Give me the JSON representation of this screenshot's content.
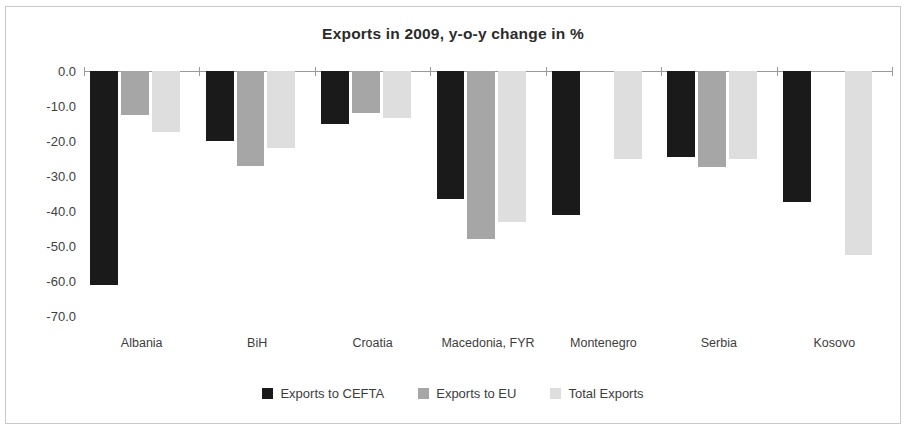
{
  "chart_data": {
    "type": "bar",
    "title": "Exports in 2009, y-o-y change in %",
    "xlabel": "",
    "ylabel": "",
    "ylim": [
      -70,
      0
    ],
    "ytick_step": 10,
    "grid": false,
    "legend_position": "bottom",
    "yticks": [
      "0.0",
      "-10.0",
      "-20.0",
      "-30.0",
      "-40.0",
      "-50.0",
      "-60.0",
      "-70.0"
    ],
    "ytick_values": [
      0,
      -10,
      -20,
      -30,
      -40,
      -50,
      -60,
      -70
    ],
    "categories": [
      "Albania",
      "BiH",
      "Croatia",
      "Macedonia, FYR",
      "Montenegro",
      "Serbia",
      "Kosovo"
    ],
    "series": [
      {
        "name": "Exports to CEFTA",
        "color": "#1a1a1a",
        "values": [
          -61.0,
          -20.0,
          -15.0,
          -36.5,
          -41.0,
          -24.5,
          -37.5
        ]
      },
      {
        "name": "Exports to EU",
        "color": "#a6a6a6",
        "values": [
          -12.5,
          -27.0,
          -12.0,
          -48.0,
          null,
          -27.5,
          null
        ]
      },
      {
        "name": "Total Exports",
        "color": "#dedede",
        "values": [
          -17.5,
          -22.0,
          -13.5,
          -43.0,
          -25.0,
          -25.0,
          -52.5
        ]
      }
    ]
  }
}
